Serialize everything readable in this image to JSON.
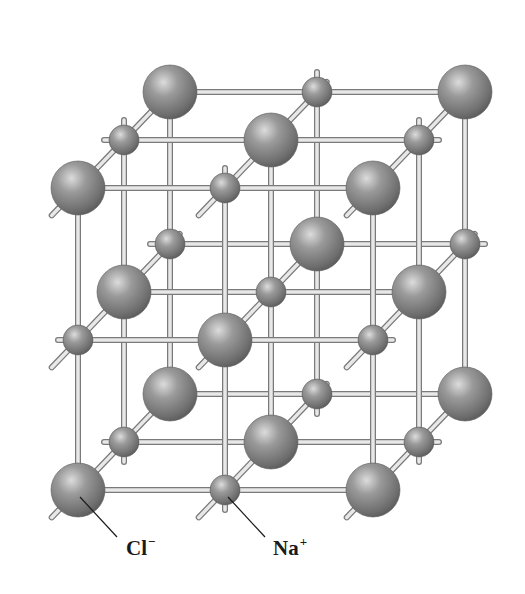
{
  "diagram": {
    "colors": {
      "background": "#ffffff",
      "sphere_dark": "#5e5e5e",
      "sphere_mid": "#8a8a8a",
      "sphere_light": "#d6d6d6",
      "rod_light": "#e8e8e8",
      "rod_dark": "#7a7a7a",
      "rod_end": "#3c3c3c",
      "leader_line": "#1a1a1a"
    },
    "geometry": {
      "front_x": [
        78,
        225,
        373
      ],
      "front_y": [
        188,
        340,
        490
      ],
      "depth_offset": [
        46,
        -48
      ],
      "layers": 3,
      "cl_radius": 27,
      "na_radius": 15
    },
    "labels": [
      {
        "id": "cl",
        "base": "Cl",
        "sup": "−",
        "x": 126,
        "y": 541,
        "pointer_from": [
          117,
          537
        ],
        "pointer_to": [
          80,
          497
        ]
      },
      {
        "id": "na",
        "base": "Na",
        "sup": "+",
        "x": 273,
        "y": 541,
        "pointer_from": [
          265,
          537
        ],
        "pointer_to": [
          228,
          497
        ]
      }
    ],
    "legend": {
      "large_sphere": "Cl− (chloride ion)",
      "small_sphere": "Na+ (sodium ion)"
    }
  }
}
